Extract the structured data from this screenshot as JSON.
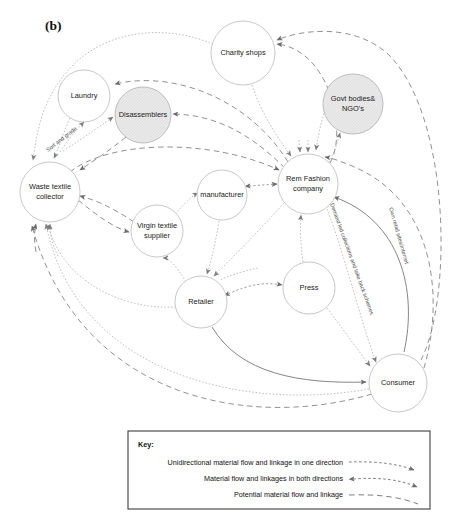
{
  "figure": {
    "panel_label": "(b)",
    "arrow_color": "#6b6b6b",
    "node_stroke_color": "#c9c9c9",
    "shaded_node_fill": "#e6e6e6"
  },
  "nodes": [
    {
      "id": "charity_shops",
      "label": "Charity shops",
      "label_lines": [
        "Charity shops"
      ],
      "cx": 243,
      "cy": 53,
      "r": 32,
      "shaded": false
    },
    {
      "id": "laundry",
      "label": "Laundry",
      "label_lines": [
        "Laundry"
      ],
      "cx": 84,
      "cy": 96,
      "r": 26,
      "shaded": false
    },
    {
      "id": "disassemblers",
      "label": "Disassemblers",
      "label_lines": [
        "Disassemblers"
      ],
      "cx": 143,
      "cy": 115,
      "r": 28,
      "shaded": true
    },
    {
      "id": "govt_ngo",
      "label": "Govt bodies& NGO's",
      "label_lines": [
        "Govt bodies&",
        "NGO's"
      ],
      "cx": 353,
      "cy": 104,
      "r": 30,
      "shaded": true
    },
    {
      "id": "waste_textile",
      "label": "Waste textile collector",
      "label_lines": [
        "Waste textile",
        "collector"
      ],
      "cx": 50,
      "cy": 192,
      "r": 30,
      "shaded": false
    },
    {
      "id": "rem_fashion",
      "label": "Rem Fashion company",
      "label_lines": [
        "Rem Fashion",
        "company"
      ],
      "cx": 308,
      "cy": 184,
      "r": 30,
      "shaded": false
    },
    {
      "id": "manufacturer",
      "label": "manufacturer",
      "label_lines": [
        "manufacturer"
      ],
      "cx": 222,
      "cy": 195,
      "r": 25,
      "shaded": false
    },
    {
      "id": "virgin_textile",
      "label": "Virgin textile supplier",
      "label_lines": [
        "Virgin textile",
        "supplier"
      ],
      "cx": 157,
      "cy": 231,
      "r": 26,
      "shaded": false
    },
    {
      "id": "retailer",
      "label": "Retailer",
      "label_lines": [
        "Retailer"
      ],
      "cx": 201,
      "cy": 302,
      "r": 26,
      "shaded": false
    },
    {
      "id": "press",
      "label": "Press",
      "label_lines": [
        "Press"
      ],
      "cx": 309,
      "cy": 288,
      "r": 26,
      "shaded": false
    },
    {
      "id": "consumer",
      "label": "Consumer",
      "label_lines": [
        "Consumer"
      ],
      "cx": 398,
      "cy": 383,
      "r": 29,
      "shaded": false
    }
  ],
  "edge_labels": [
    {
      "id": "sort_and_grade",
      "text": "Sort and grade"
    },
    {
      "id": "demand_led",
      "text": "Demand led collections and take back schemes"
    },
    {
      "id": "own_retail",
      "text": "Own retail sites/internet"
    }
  ],
  "key": {
    "title": "Key:",
    "entries": [
      {
        "id": "unidirectional",
        "text": "Unidirectional material flow and linkage in one direction",
        "style": "short-dash-one-arrow"
      },
      {
        "id": "bidirectional",
        "text": "Material flow and linkages in both directions",
        "style": "short-dash-two-arrows"
      },
      {
        "id": "potential",
        "text": "Potential material flow  and linkage",
        "style": "long-dash-no-arrow"
      }
    ]
  }
}
